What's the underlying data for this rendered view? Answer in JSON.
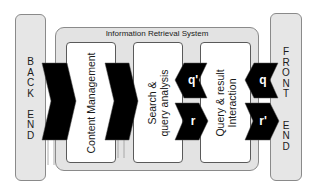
{
  "diagram": {
    "title": "Information Retrieval System",
    "back_end": {
      "letters": [
        "B",
        "A",
        "C",
        "K",
        "",
        "E",
        "N",
        "D"
      ]
    },
    "front_end": {
      "letters": [
        "F",
        "R",
        "O",
        "N",
        "T",
        "",
        "E",
        "N",
        "D"
      ]
    },
    "components": [
      {
        "id": "content-management",
        "lines": [
          "Content Management"
        ]
      },
      {
        "id": "search-query-analysis",
        "lines": [
          "Search &",
          "query analysis"
        ]
      },
      {
        "id": "query-result-interaction",
        "lines": [
          "Query & result",
          "Interaction"
        ]
      }
    ],
    "arrows": {
      "q_prime": "q'",
      "r": "r",
      "q": "q",
      "r_prime": "r'"
    },
    "colors": {
      "arrow_fill": "#000000",
      "container_fill": "#e3e3e3",
      "side_fill": "#e6e6e6",
      "component_fill": "#ffffff",
      "border": "#8a8a8a"
    }
  }
}
